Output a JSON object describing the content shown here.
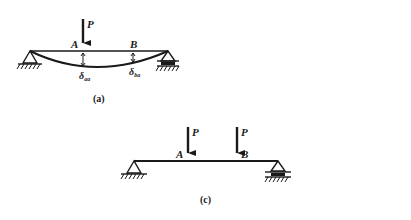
{
  "figure_a": {
    "caption": "(a)",
    "load_label": "P",
    "point_a": "A",
    "point_b": "B",
    "deflection_a": "δ",
    "deflection_a_sub": "aa",
    "deflection_b": "δ",
    "deflection_b_sub": "ba"
  },
  "figure_b": {
    "caption": "(b)",
    "load_label": "P",
    "point_a": "A",
    "point_b": "B",
    "deflection_a": "δ",
    "deflection_a_sub": "ab",
    "deflection_b": "δ",
    "deflection_b_sub": "bb"
  },
  "figure_c": {
    "caption": "(c)",
    "load_label_a": "P",
    "load_label_b": "P",
    "point_a": "A",
    "point_b": "B"
  },
  "colors": {
    "ink": "#1a1a1a",
    "background": "#ffffff"
  }
}
